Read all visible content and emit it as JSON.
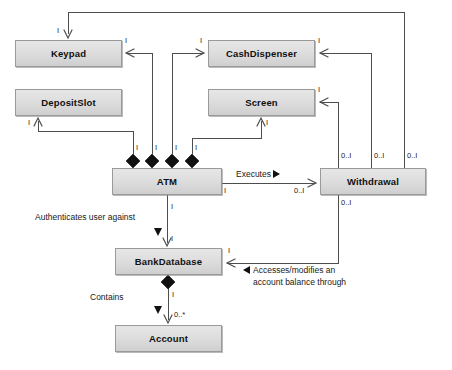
{
  "diagram": {
    "kind": "uml-class-diagram",
    "background_color": "#ffffff",
    "box_fill": "#dcdcdc",
    "box_border": "#9a9a9a",
    "line_color": "#4d4d4d",
    "text_color": "#101010"
  },
  "classes": [
    {
      "id": "keypad",
      "name": "Keypad",
      "x": 15,
      "y": 40,
      "w": 107,
      "h": 27
    },
    {
      "id": "cashdispenser",
      "name": "CashDispenser",
      "x": 208,
      "y": 40,
      "w": 107,
      "h": 27
    },
    {
      "id": "depositslot",
      "name": "DepositSlot",
      "x": 15,
      "y": 89,
      "w": 107,
      "h": 27
    },
    {
      "id": "screen",
      "name": "Screen",
      "x": 208,
      "y": 89,
      "w": 107,
      "h": 27
    },
    {
      "id": "atm",
      "name": "ATM",
      "x": 112,
      "y": 168,
      "w": 110,
      "h": 27
    },
    {
      "id": "withdrawal",
      "name": "Withdrawal",
      "x": 320,
      "y": 168,
      "w": 106,
      "h": 27
    },
    {
      "id": "bankdatabase",
      "name": "BankDatabase",
      "x": 115,
      "y": 248,
      "w": 107,
      "h": 27
    },
    {
      "id": "account",
      "name": "Account",
      "x": 115,
      "y": 325,
      "w": 107,
      "h": 27
    }
  ],
  "associations": [
    {
      "id": "executes",
      "label": "Executes",
      "marker": "triangle-right",
      "from": "atm",
      "to": "withdrawal"
    },
    {
      "id": "authenticates",
      "label": "Authenticates user against",
      "marker": "triangle-down",
      "from": "atm",
      "to": "bankdatabase"
    },
    {
      "id": "contains",
      "label": "Contains",
      "marker": "triangle-down",
      "from": "bankdatabase",
      "to": "account"
    },
    {
      "id": "accesses",
      "label_line1": "Accesses/modifies an",
      "label_line2": "account balance through",
      "marker": "triangle-left",
      "from": "withdrawal",
      "to": "bankdatabase"
    }
  ],
  "multiplicities": {
    "keypad_top": "I",
    "keypad_right": "I",
    "cashdispenser_left": "I",
    "cashdispenser_right": "I",
    "screen_right": "I",
    "depositslot_bottom": "I",
    "screen_bottom": "I",
    "atm_comp_1": "I",
    "atm_comp_2": "I",
    "atm_comp_3": "I",
    "atm_comp_4": "I",
    "withdrawal_top_1": "0..I",
    "withdrawal_top_2": "0..I",
    "withdrawal_top_3": "0..I",
    "withdrawal_bottom": "0..I",
    "atm_executes_near": "I",
    "withdrawal_executes_near": "0..I",
    "atm_auth_near": "I",
    "bankdatabase_auth_near": "I",
    "bankdatabase_access_near": "I",
    "bankdatabase_contains_near": "I",
    "account_contains_near": "0..*"
  }
}
